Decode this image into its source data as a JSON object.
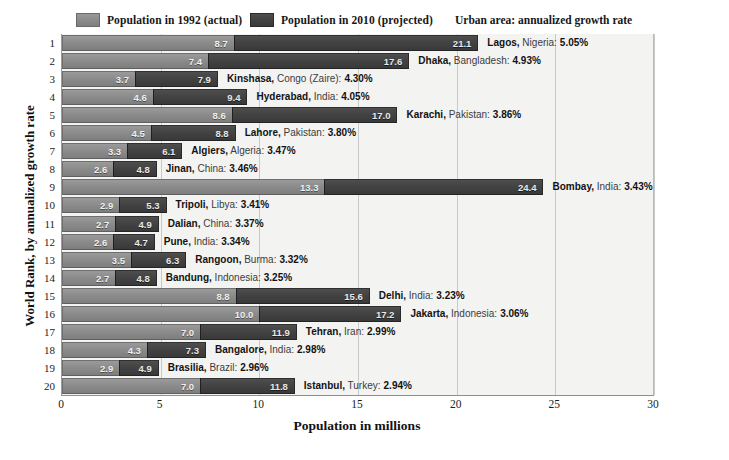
{
  "legend": {
    "entry_1992": {
      "label": "Population in 1992 (actual)",
      "color": "#8c8c8c",
      "icon": "legend-swatch-icon"
    },
    "entry_2010": {
      "label": "Population in 2010 (projected)",
      "color": "#434343",
      "icon": "legend-swatch-icon"
    },
    "note": "Urban area:  annualized growth rate"
  },
  "chart_data": {
    "type": "bar",
    "title": "",
    "subtitle": "Urban area:  annualized growth rate",
    "xlabel": "Population in millions",
    "ylabel": "World Rank, by annualized growth rate",
    "xlim": [
      0,
      30
    ],
    "xticks": [
      0,
      5,
      10,
      15,
      20,
      25,
      30
    ],
    "yticks": [
      1,
      2,
      3,
      4,
      5,
      6,
      7,
      8,
      9,
      10,
      11,
      12,
      13,
      14,
      15,
      16,
      17,
      18,
      19,
      20
    ],
    "grid": true,
    "legend_position": "top",
    "orientation": "horizontal",
    "categories": [
      "Lagos, Nigeria",
      "Dhaka, Bangladesh",
      "Kinshasa, Congo (Zaire)",
      "Hyderabad, India",
      "Karachi, Pakistan",
      "Lahore, Pakistan",
      "Algiers, Algeria",
      "Jinan, China",
      "Bombay, India",
      "Tripoli, Libya",
      "Dalian, China",
      "Pune, India",
      "Rangoon, Burma",
      "Bandung, Indonesia",
      "Delhi, India",
      "Jakarta, Indonesia",
      "Tehran, Iran",
      "Bangalore, India",
      "Brasilia, Brazil",
      "Istanbul, Turkey"
    ],
    "series": [
      {
        "name": "Population in 1992 (actual)",
        "color": "#8c8c8c",
        "values": [
          8.7,
          7.4,
          3.7,
          4.6,
          8.6,
          4.5,
          3.3,
          2.6,
          13.3,
          2.9,
          2.7,
          2.6,
          3.5,
          2.7,
          8.8,
          10.0,
          7.0,
          4.3,
          2.9,
          7.0
        ]
      },
      {
        "name": "Population in 2010 (projected)",
        "color": "#434343",
        "values": [
          21.1,
          17.6,
          7.9,
          9.4,
          17.0,
          8.8,
          6.1,
          4.8,
          24.4,
          5.3,
          4.9,
          4.7,
          6.3,
          4.8,
          15.6,
          17.2,
          11.9,
          7.3,
          4.9,
          11.8
        ]
      }
    ],
    "growth_rates": [
      "5.05%",
      "4.93%",
      "4.30%",
      "4.05%",
      "3.86%",
      "3.80%",
      "3.47%",
      "3.46%",
      "3.43%",
      "3.41%",
      "3.37%",
      "3.34%",
      "3.32%",
      "3.25%",
      "3.23%",
      "3.06%",
      "2.99%",
      "2.98%",
      "2.96%",
      "2.94%"
    ]
  },
  "rows": [
    {
      "rank": "1",
      "city": "Lagos,",
      "country": "Nigeria:",
      "rate": "5.05%",
      "v1992": 8.7,
      "v2010": 21.1,
      "l1992": "8.7",
      "l2010": "21.1"
    },
    {
      "rank": "2",
      "city": "Dhaka,",
      "country": "Bangladesh:",
      "rate": "4.93%",
      "v1992": 7.4,
      "v2010": 17.6,
      "l1992": "7.4",
      "l2010": "17.6"
    },
    {
      "rank": "3",
      "city": "Kinshasa,",
      "country": "Congo (Zaire):",
      "rate": "4.30%",
      "v1992": 3.7,
      "v2010": 7.9,
      "l1992": "3.7",
      "l2010": "7.9"
    },
    {
      "rank": "4",
      "city": "Hyderabad,",
      "country": "India:",
      "rate": "4.05%",
      "v1992": 4.6,
      "v2010": 9.4,
      "l1992": "4.6",
      "l2010": "9.4"
    },
    {
      "rank": "5",
      "city": "Karachi,",
      "country": "Pakistan:",
      "rate": "3.86%",
      "v1992": 8.6,
      "v2010": 17.0,
      "l1992": "8.6",
      "l2010": "17.0"
    },
    {
      "rank": "6",
      "city": "Lahore,",
      "country": "Pakistan:",
      "rate": "3.80%",
      "v1992": 4.5,
      "v2010": 8.8,
      "l1992": "4.5",
      "l2010": "8.8"
    },
    {
      "rank": "7",
      "city": "Algiers,",
      "country": "Algeria:",
      "rate": "3.47%",
      "v1992": 3.3,
      "v2010": 6.1,
      "l1992": "3.3",
      "l2010": "6.1"
    },
    {
      "rank": "8",
      "city": "Jinan,",
      "country": "China:",
      "rate": "3.46%",
      "v1992": 2.6,
      "v2010": 4.8,
      "l1992": "2.6",
      "l2010": "4.8"
    },
    {
      "rank": "9",
      "city": "Bombay,",
      "country": "India:",
      "rate": "3.43%",
      "v1992": 13.3,
      "v2010": 24.4,
      "l1992": "13.3",
      "l2010": "24.4"
    },
    {
      "rank": "10",
      "city": "Tripoli,",
      "country": "Libya:",
      "rate": "3.41%",
      "v1992": 2.9,
      "v2010": 5.3,
      "l1992": "2.9",
      "l2010": "5.3"
    },
    {
      "rank": "11",
      "city": "Dalian,",
      "country": "China:",
      "rate": "3.37%",
      "v1992": 2.7,
      "v2010": 4.9,
      "l1992": "2.7",
      "l2010": "4.9"
    },
    {
      "rank": "12",
      "city": "Pune,",
      "country": "India:",
      "rate": "3.34%",
      "v1992": 2.6,
      "v2010": 4.7,
      "l1992": "2.6",
      "l2010": "4.7"
    },
    {
      "rank": "13",
      "city": "Rangoon,",
      "country": "Burma:",
      "rate": "3.32%",
      "v1992": 3.5,
      "v2010": 6.3,
      "l1992": "3.5",
      "l2010": "6.3"
    },
    {
      "rank": "14",
      "city": "Bandung,",
      "country": "Indonesia:",
      "rate": "3.25%",
      "v1992": 2.7,
      "v2010": 4.8,
      "l1992": "2.7",
      "l2010": "4.8"
    },
    {
      "rank": "15",
      "city": "Delhi,",
      "country": "India:",
      "rate": "3.23%",
      "v1992": 8.8,
      "v2010": 15.6,
      "l1992": "8.8",
      "l2010": "15.6"
    },
    {
      "rank": "16",
      "city": "Jakarta,",
      "country": "Indonesia:",
      "rate": "3.06%",
      "v1992": 10.0,
      "v2010": 17.2,
      "l1992": "10.0",
      "l2010": "17.2"
    },
    {
      "rank": "17",
      "city": "Tehran,",
      "country": "Iran:",
      "rate": "2.99%",
      "v1992": 7.0,
      "v2010": 11.9,
      "l1992": "7.0",
      "l2010": "11.9"
    },
    {
      "rank": "18",
      "city": "Bangalore,",
      "country": "India:",
      "rate": "2.98%",
      "v1992": 4.3,
      "v2010": 7.3,
      "l1992": "4.3",
      "l2010": "7.3"
    },
    {
      "rank": "19",
      "city": "Brasilia,",
      "country": "Brazil:",
      "rate": "2.96%",
      "v1992": 2.9,
      "v2010": 4.9,
      "l1992": "2.9",
      "l2010": "4.9"
    },
    {
      "rank": "20",
      "city": "Istanbul,",
      "country": "Turkey:",
      "rate": "2.94%",
      "v1992": 7.0,
      "v2010": 11.8,
      "l1992": "7.0",
      "l2010": "11.8"
    }
  ],
  "axes": {
    "xlabel": "Population in millions",
    "ylabel": "World Rank, by annualized growth rate",
    "xticks": [
      "0",
      "5",
      "10",
      "15",
      "20",
      "25",
      "30"
    ]
  }
}
